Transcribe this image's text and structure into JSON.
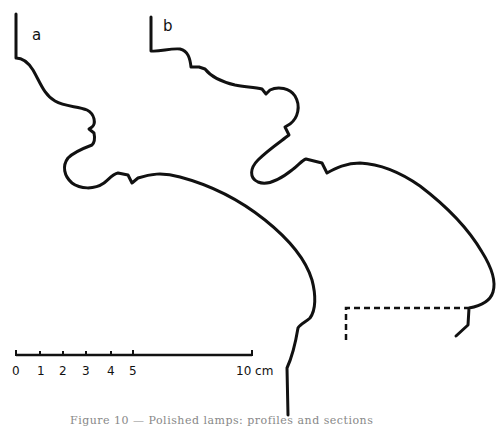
{
  "figure": {
    "panels": [
      {
        "label": "a"
      },
      {
        "label": "b"
      }
    ],
    "scale_bar": {
      "ticks": [
        "0",
        "1",
        "2",
        "3",
        "4",
        "5"
      ],
      "end_label": "10 cm"
    },
    "caption": "Figure 10 — Polished lamps: profiles and sections"
  },
  "colors": {
    "ink": "#111111",
    "background": "#ffffff"
  }
}
